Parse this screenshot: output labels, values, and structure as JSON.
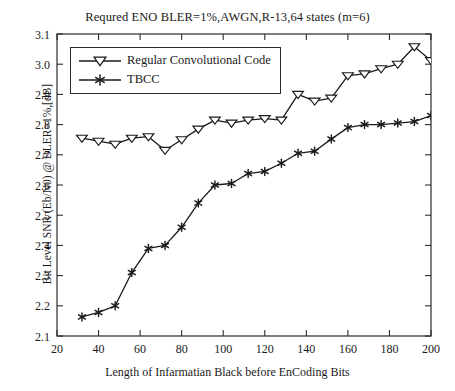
{
  "chart_data": {
    "type": "line",
    "title": "Requred ENO BLER=1%,AWGN,R-13,64 states (m=6)",
    "xlabel": "Length of Infarmatian Black before EnCoding Bits",
    "ylabel": "Bit Level SNR (Eb/N0) @ BLER=1%,[dB]",
    "xlim": [
      20,
      200
    ],
    "ylim": [
      2.1,
      3.1
    ],
    "xticks": [
      20,
      40,
      60,
      80,
      100,
      120,
      140,
      160,
      180,
      200
    ],
    "yticks": [
      "2.1",
      "2.2",
      "2.3",
      "2.4",
      "2.5",
      "2.6",
      "2.7",
      "2.8",
      "2.9",
      "3.0",
      "3.1"
    ],
    "grid": false,
    "legend_position": "upper-left",
    "series": [
      {
        "name": "Regular Convolutional Code",
        "marker": "triangle-down",
        "color": "#1a1a1a",
        "x": [
          32,
          40,
          48,
          56,
          64,
          72,
          80,
          88,
          96,
          104,
          112,
          120,
          128,
          136,
          144,
          152,
          160,
          168,
          176,
          184,
          192,
          200
        ],
        "y": [
          2.755,
          2.745,
          2.735,
          2.755,
          2.76,
          2.715,
          2.75,
          2.785,
          2.815,
          2.805,
          2.815,
          2.82,
          2.815,
          2.9,
          2.878,
          2.888,
          2.962,
          2.968,
          2.985,
          3.0,
          3.058,
          3.012
        ]
      },
      {
        "name": "TBCC",
        "marker": "asterisk",
        "color": "#1a1a1a",
        "x": [
          32,
          40,
          48,
          56,
          64,
          72,
          80,
          88,
          96,
          104,
          112,
          120,
          128,
          136,
          144,
          152,
          160,
          168,
          176,
          184,
          192,
          200
        ],
        "y": [
          2.163,
          2.178,
          2.2,
          2.31,
          2.39,
          2.4,
          2.46,
          2.54,
          2.6,
          2.605,
          2.638,
          2.645,
          2.672,
          2.705,
          2.712,
          2.752,
          2.79,
          2.8,
          2.8,
          2.805,
          2.81,
          2.83
        ]
      }
    ]
  },
  "legend": {
    "items": [
      {
        "label": "Regular Convolutional Code"
      },
      {
        "label": "TBCC"
      }
    ]
  }
}
